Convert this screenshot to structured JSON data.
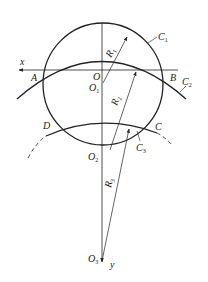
{
  "diagram": {
    "type": "geometry-construction",
    "colors": {
      "stroke": "#222222",
      "background": "#ffffff"
    },
    "axes": {
      "x": {
        "label": "x",
        "direction": "left"
      },
      "y": {
        "label": "y",
        "direction": "down"
      }
    },
    "points": {
      "A": "A",
      "B": "B",
      "C": "C",
      "D": "D",
      "O": "O",
      "O1": {
        "main": "O",
        "sub": "1"
      },
      "O2": {
        "main": "O",
        "sub": "2"
      },
      "O3": {
        "main": "O",
        "sub": "3"
      }
    },
    "curves": {
      "C1": {
        "main": "C",
        "sub": "1"
      },
      "C2": {
        "main": "C",
        "sub": "2"
      },
      "C3": {
        "main": "C",
        "sub": "3"
      }
    },
    "radii": {
      "R1": {
        "main": "R",
        "sub": "1"
      },
      "R2": {
        "main": "R",
        "sub": "2"
      },
      "R3": {
        "main": "R",
        "sub": "3"
      }
    }
  }
}
